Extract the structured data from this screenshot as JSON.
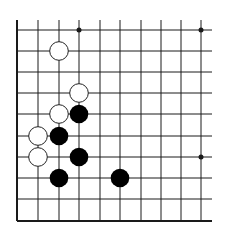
{
  "board": {
    "description": "Go board corner diagram (lower-left corner)",
    "columns": 10,
    "rows": 10,
    "origin_x": 17,
    "origin_y": 30,
    "col_spacing": 20.5,
    "row_spacing": 21.2,
    "line_color": "#1a1a1a",
    "stone_black": "#000000",
    "stone_white": "#ffffff",
    "star_points": [
      {
        "col": 3,
        "row": 0
      },
      {
        "col": 9,
        "row": 0
      },
      {
        "col": 9,
        "row": 6
      }
    ],
    "white_stones": [
      {
        "col": 2,
        "row": 1
      },
      {
        "col": 3,
        "row": 3
      },
      {
        "col": 2,
        "row": 4
      },
      {
        "col": 1,
        "row": 5
      },
      {
        "col": 1,
        "row": 6
      }
    ],
    "black_stones": [
      {
        "col": 3,
        "row": 4
      },
      {
        "col": 2,
        "row": 5
      },
      {
        "col": 3,
        "row": 6
      },
      {
        "col": 2,
        "row": 7
      },
      {
        "col": 5,
        "row": 7
      }
    ]
  }
}
